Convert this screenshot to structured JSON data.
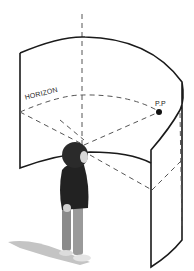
{
  "figure": {
    "labels": {
      "horizon": "HORIZON",
      "pp": "P.P"
    },
    "colors": {
      "line": "#1a1a1a",
      "dash": "#555555",
      "figure_dark": "#222222",
      "figure_legs": "#8a8a8a",
      "shadow": "#bfbfbf",
      "background": "#ffffff"
    }
  }
}
